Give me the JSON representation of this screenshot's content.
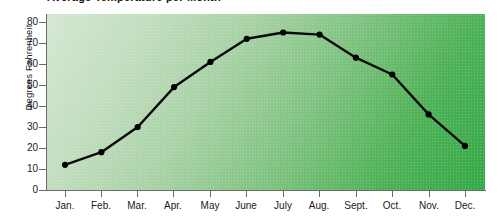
{
  "chart_data": {
    "type": "line",
    "title": "Average Temperature per Month",
    "xlabel": "",
    "ylabel": "Degrees Fahrenheit",
    "categories": [
      "Jan.",
      "Feb.",
      "Mar.",
      "Apr.",
      "May",
      "June",
      "July",
      "Aug.",
      "Sept.",
      "Oct.",
      "Nov.",
      "Dec."
    ],
    "values": [
      12,
      18,
      30,
      49,
      61,
      72,
      75,
      74,
      63,
      55,
      36,
      21
    ],
    "series": [
      {
        "name": "Degrees Fahrenheit",
        "values": [
          12,
          18,
          30,
          49,
          61,
          72,
          75,
          74,
          63,
          55,
          36,
          21
        ]
      }
    ],
    "ylim": [
      0,
      80
    ],
    "yticks": [
      0,
      10,
      20,
      30,
      40,
      50,
      60,
      70,
      80
    ],
    "ytick_labels": [
      "0",
      "10",
      "20",
      "30",
      "40",
      "50",
      "60",
      "70",
      "80"
    ],
    "grid": false,
    "legend": "none",
    "marker": "filled-circle",
    "line_color": "#000000",
    "plot_background": "green-gradient-light-to-dark",
    "plot_background_colors": [
      "#d5e7d2",
      "#35a948"
    ]
  },
  "axis": {
    "y_title": "Degrees Fahrenheit"
  },
  "title": {
    "text": "Average Temperature per Month"
  }
}
